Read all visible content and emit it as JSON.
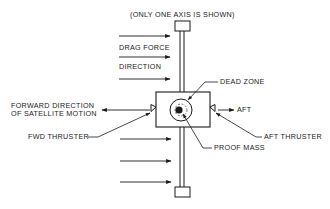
{
  "diagram": {
    "caption": "(ONLY ONE AXIS IS SHOWN)",
    "labels": {
      "drag_force": "DRAG FORCE",
      "direction": "DIRECTION",
      "dead_zone": "DEAD ZONE",
      "forward_line1": "FORWARD DIRECTION",
      "forward_line2": "OF SATELLITE MOTION",
      "aft": "AFT",
      "fwd_thruster": "FWD THRUSTER",
      "aft_thruster": "AFT THRUSTER",
      "proof_mass": "PROOF MASS"
    },
    "drag_arrows_count": 6,
    "colors": {
      "line": "#1a1a1a",
      "background": "#ffffff"
    }
  }
}
